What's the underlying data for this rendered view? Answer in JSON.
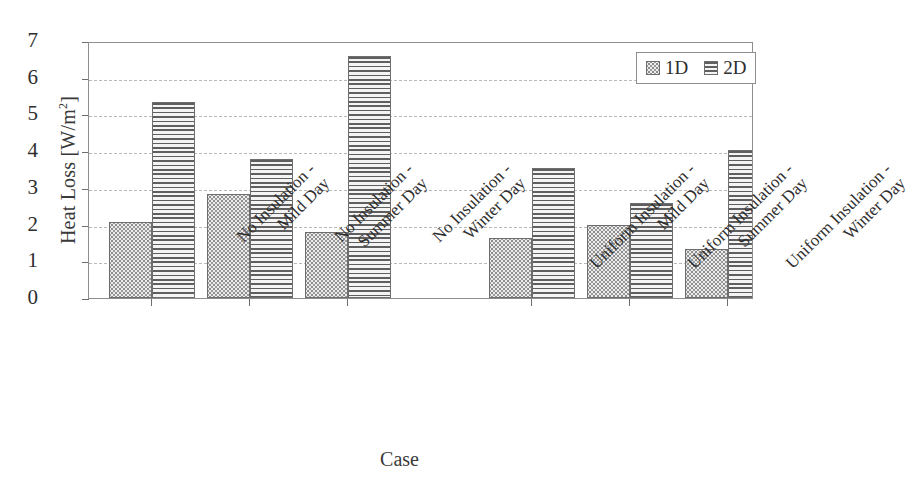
{
  "chart_data": {
    "type": "bar",
    "title": "",
    "xlabel": "Case",
    "ylabel": "Heat Loss [W/m",
    "ylabel_sup": "2",
    "ylabel_suffix": "]",
    "ylim": [
      0,
      7
    ],
    "yticks": [
      0,
      1,
      2,
      3,
      4,
      5,
      6,
      7
    ],
    "ytick_labels": [
      "0",
      "1",
      "2",
      "3",
      "4",
      "5",
      "6",
      "7"
    ],
    "grid": true,
    "grid_axis": "y",
    "legend_position": "upper right",
    "categories": [
      "No Insulation - Mild Day",
      "No Insulation - Summer Day",
      "No Insulation - Winter Day",
      "Uniform Insulation - Mild Day",
      "Uniform Insulation - Summer Day",
      "Uniform Insulation - Winter Day"
    ],
    "category_lines": [
      {
        "line1": "No Insulation -",
        "line2": "Mild Day"
      },
      {
        "line1": "No Insulation -",
        "line2": "Summer Day"
      },
      {
        "line1": "No Insulation -",
        "line2": "Winter Day"
      },
      {
        "line1": "Uniform Insulation -",
        "line2": "Mild Day"
      },
      {
        "line1": "Uniform Insulation -",
        "line2": "Summer Day"
      },
      {
        "line1": "Uniform Insulation -",
        "line2": "Winter Day"
      }
    ],
    "series": [
      {
        "name": "1D",
        "pattern": "dotted",
        "values": [
          2.08,
          2.82,
          1.8,
          1.63,
          2.0,
          1.34
        ]
      },
      {
        "name": "2D",
        "pattern": "horizontal-lines",
        "values": [
          5.33,
          3.78,
          6.58,
          3.55,
          2.58,
          4.02
        ]
      }
    ]
  },
  "legend": {
    "entries": [
      {
        "label": "1D"
      },
      {
        "label": "2D"
      }
    ]
  }
}
